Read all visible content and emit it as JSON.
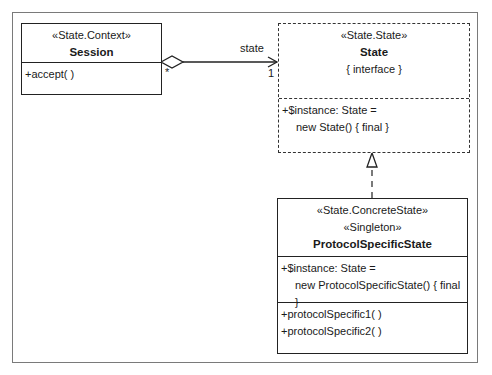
{
  "diagram": {
    "type": "UML class diagram",
    "classes": [
      {
        "id": "session",
        "stereotypes": [
          "«State.Context»"
        ],
        "name": "Session",
        "attributes": [],
        "operations": [
          "+accept( )"
        ]
      },
      {
        "id": "state",
        "stereotypes": [
          "«State.State»"
        ],
        "name": "State",
        "constraint": "{ interface }",
        "attributes": [
          "+$instance: State =",
          "new State() { final }"
        ],
        "operations": []
      },
      {
        "id": "protocol-specific-state",
        "stereotypes": [
          "«State.ConcreteState»",
          "«Singleton»"
        ],
        "name": "ProtocolSpecificState",
        "attributes": [
          "+$instance: State =",
          "new ProtocolSpecificState() { final }"
        ],
        "operations": [
          "+protocolSpecific1( )",
          "+protocolSpecific2( )"
        ]
      }
    ],
    "relationships": [
      {
        "kind": "aggregation",
        "from": "Session",
        "to": "State",
        "role": "state",
        "from_multiplicity": "*",
        "to_multiplicity": "1"
      },
      {
        "kind": "realization",
        "from": "ProtocolSpecificState",
        "to": "State"
      }
    ]
  }
}
